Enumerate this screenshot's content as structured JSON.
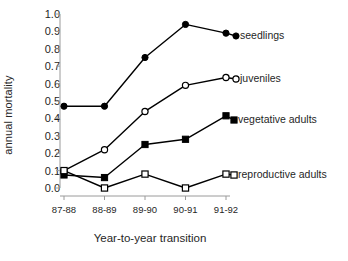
{
  "chart_data": {
    "type": "line",
    "title": "",
    "xlabel": "Year-to-year transition",
    "ylabel": "annual mortality",
    "categories": [
      "87-88",
      "88-89",
      "89-90",
      "90-91",
      "91-92"
    ],
    "ylim": [
      0.0,
      1.0
    ],
    "ytick_labels": [
      "0.0",
      "0.1",
      "0.2",
      "0.3",
      "0.4",
      "0.5",
      "0.6",
      "0.7",
      "0.8",
      "0.9",
      "1.0"
    ],
    "ytick_values": [
      0.0,
      0.1,
      0.2,
      0.3,
      0.4,
      0.5,
      0.6,
      0.7,
      0.8,
      0.9,
      1.0
    ],
    "grid": false,
    "legend_position": "inline-right",
    "series": [
      {
        "name": "seedlings",
        "marker": "filled-circle",
        "color": "#000000",
        "values": [
          0.47,
          0.47,
          0.75,
          0.94,
          0.89
        ]
      },
      {
        "name": "juveniles",
        "marker": "open-circle",
        "color": "#000000",
        "values": [
          0.1,
          0.22,
          0.44,
          0.59,
          0.635
        ]
      },
      {
        "name": "vegetative adults",
        "marker": "filled-square",
        "color": "#000000",
        "values": [
          0.075,
          0.06,
          0.25,
          0.28,
          0.415
        ]
      },
      {
        "name": "reproductive adults",
        "marker": "open-square",
        "color": "#000000",
        "values": [
          0.1,
          0.0,
          0.08,
          0.0,
          0.08
        ]
      }
    ]
  }
}
